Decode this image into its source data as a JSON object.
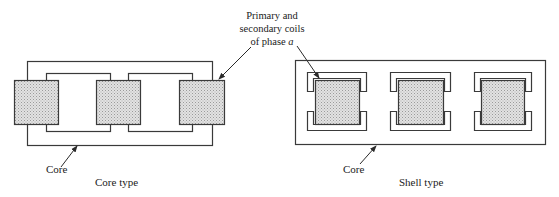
{
  "figure": {
    "callout": {
      "line1": "Primary and",
      "line2": "secondary coils",
      "line3_prefix": "of phase ",
      "line3_var": "a"
    },
    "core_type": {
      "caption": "Core type",
      "core_label": "Core",
      "coil_count": 3
    },
    "shell_type": {
      "caption": "Shell type",
      "core_label": "Core",
      "coil_count": 3
    },
    "colors": {
      "line": "#3a3a3a",
      "coil_fill": "#d4d4d4",
      "background": "#ffffff"
    }
  }
}
